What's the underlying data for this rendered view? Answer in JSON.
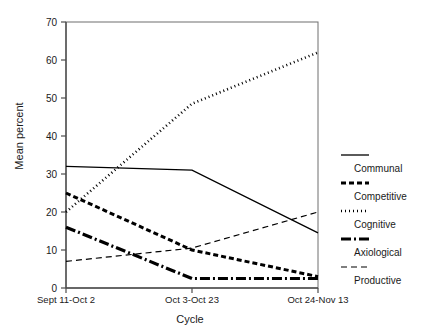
{
  "chart_data": {
    "type": "line",
    "title": "",
    "xlabel": "Cycle",
    "ylabel": "Mean percent",
    "categories": [
      "Sept 11-Oct 2",
      "Oct 3-Oct 23",
      "Oct 24-Nov 13"
    ],
    "ylim": [
      0,
      70
    ],
    "yticks": [
      0,
      10,
      20,
      30,
      40,
      50,
      60,
      70
    ],
    "grid": false,
    "legend_position": "right",
    "series": [
      {
        "name": "Communal",
        "values": [
          32,
          31,
          14.5
        ],
        "style": "solid",
        "color": "#000000"
      },
      {
        "name": "Competitive",
        "values": [
          25,
          10,
          3
        ],
        "style": "dashed-thick",
        "color": "#000000"
      },
      {
        "name": "Cognitive",
        "values": [
          20,
          48.5,
          62
        ],
        "style": "dotted",
        "color": "#000000"
      },
      {
        "name": "Axiological",
        "values": [
          16,
          2.5,
          2.5
        ],
        "style": "dashdot-thick",
        "color": "#000000"
      },
      {
        "name": "Productive",
        "values": [
          7,
          10.5,
          20
        ],
        "style": "dashed-thin",
        "color": "#000000"
      }
    ]
  },
  "axis": {
    "ytick_labels": [
      "0",
      "10",
      "20",
      "30",
      "40",
      "50",
      "60",
      "70"
    ],
    "xtick_labels": [
      "Sept 11-Oct 2",
      "Oct 3-Oct 23",
      "Oct 24-Nov 13"
    ],
    "ylabel": "Mean percent",
    "xlabel": "Cycle"
  },
  "legend": {
    "items": [
      {
        "label": "Communal"
      },
      {
        "label": "Competitive"
      },
      {
        "label": "Cognitive"
      },
      {
        "label": "Axiological"
      },
      {
        "label": "Productive"
      }
    ]
  }
}
